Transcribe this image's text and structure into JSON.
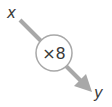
{
  "diagram": {
    "type": "function-machine",
    "input_label": "x",
    "output_label": "y",
    "operation": "×8",
    "colors": {
      "arrow": "#a8a8a8",
      "circle_stroke": "#a8a8a8",
      "circle_fill": "#ffffff",
      "text": "#3a3a3a"
    }
  }
}
